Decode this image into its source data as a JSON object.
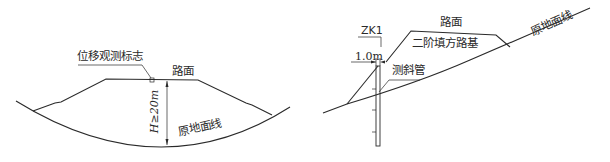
{
  "left_diagram": {
    "marker_label": "位移观测标志",
    "road_surface_label": "路面",
    "height_label": "H≥20m",
    "ground_line_label": "原地面线"
  },
  "right_diagram": {
    "borehole_label": "ZK1",
    "offset_label": "1.0m",
    "road_surface_label": "路面",
    "embankment_label": "二阶填方路基",
    "inclinometer_label": "测斜管",
    "ground_line_label": "原地面线"
  },
  "colors": {
    "line": "#2a2a2a",
    "background": "#ffffff"
  }
}
